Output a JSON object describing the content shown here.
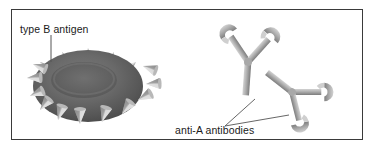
{
  "figure": {
    "frame": {
      "border_color": "#3a3a3a",
      "background_color": "#ffffff",
      "x": 11,
      "y": 9,
      "width": 352,
      "height": 131
    }
  },
  "labels": {
    "antigen": "type B antigen",
    "antibodies": "anti-A antibodies"
  },
  "colors": {
    "cell_body": "#6b6b6b",
    "cell_body_dark": "#4e4e4e",
    "cell_center": "#5a5a5a",
    "cell_edge": "#3f3f3f",
    "spike_light": "#e0e0e0",
    "spike_mid": "#c2c2c2",
    "spike_dark": "#8f8f8f",
    "antibody_light": "#c8c8c8",
    "antibody_mid": "#9a9a9a",
    "antibody_dark": "#7d7d7d",
    "leader_line": "#555555",
    "text": "#1a1a1a"
  },
  "diagram": {
    "cell": {
      "name": "red-blood-cell-type-b",
      "center_x": 88,
      "center_y": 86,
      "radius_x": 57,
      "radius_y": 38,
      "spike_count": 16,
      "description": "oval red blood cell bearing type B antigen spikes"
    },
    "antibodies": [
      {
        "name": "anti-a-antibody-upper",
        "shape": "Y",
        "binding_sites": 3,
        "description": "upper-left Y-shaped antibody with crescent binding tips"
      },
      {
        "name": "anti-a-antibody-lower",
        "shape": "Y",
        "binding_sites": 3,
        "description": "lower-right rotated Y-shaped antibody with crescent binding tips"
      }
    ],
    "leader_lines": [
      {
        "name": "leader-antigen",
        "from": [
          51,
          34
        ],
        "to": [
          51,
          62
        ]
      },
      {
        "name": "leader-antibody-upper",
        "from": [
          224,
          126
        ],
        "to": [
          254,
          100
        ]
      },
      {
        "name": "leader-antibody-lower",
        "from": [
          224,
          126
        ],
        "to": [
          288,
          114
        ]
      }
    ]
  }
}
